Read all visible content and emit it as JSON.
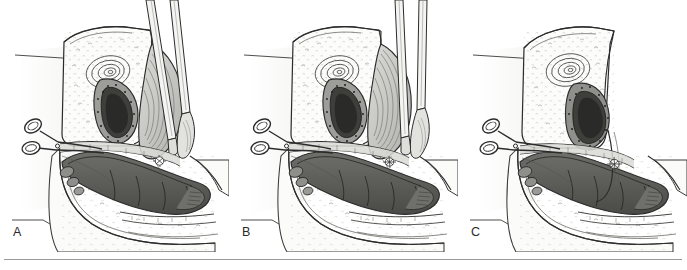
{
  "figure": {
    "style": "black-and-white pen-and-ink line drawing with gray wash shading",
    "panel_count": 3,
    "background_color": "#ffffff",
    "line_color": "#2b2b2b",
    "rule_color": "#9a9a9a",
    "shading_colors": {
      "light_tissue": "#f2f2f0",
      "mid_tissue": "#c9c9c6",
      "dark_tissue": "#8a8a87",
      "lumen_dark": "#5c5c59",
      "deepest": "#3a3a38",
      "instrument_steel": "#e6e6e4"
    }
  },
  "panels": [
    {
      "id": "panel-a",
      "label": "A",
      "description": "Sagittal section of the pelvis showing the bladder and uterus above, the rectum below, with a curved retractor blade elevating tissue on the right and scissors entering from the left at the vesicovaginal plane. Two instrument shafts extend to the top of the frame.",
      "has_long_instrument_shafts": true,
      "shaft_count": 2,
      "has_scissors": true,
      "has_retractor": true,
      "leader_lines": 2
    },
    {
      "id": "panel-b",
      "label": "B",
      "description": "Same sagittal pelvic section with the dissection advanced; the retractor and scissors remain in place and the instrument shafts are angled further to the right.",
      "has_long_instrument_shafts": true,
      "shaft_count": 2,
      "has_scissors": true,
      "has_retractor": true,
      "leader_lines": 2
    },
    {
      "id": "panel-c",
      "label": "C",
      "description": "Final sagittal pelvic section after the instruments and retractor have been withdrawn; only the scissors remain at the left, and the restored anatomic relationships of bladder, uterus and rectum are shown.",
      "has_long_instrument_shafts": false,
      "shaft_count": 0,
      "has_scissors": true,
      "has_retractor": false,
      "leader_lines": 2
    }
  ],
  "bottom_rule": {
    "present": true,
    "description": "single thin horizontal rule across the width beneath the three panels"
  }
}
